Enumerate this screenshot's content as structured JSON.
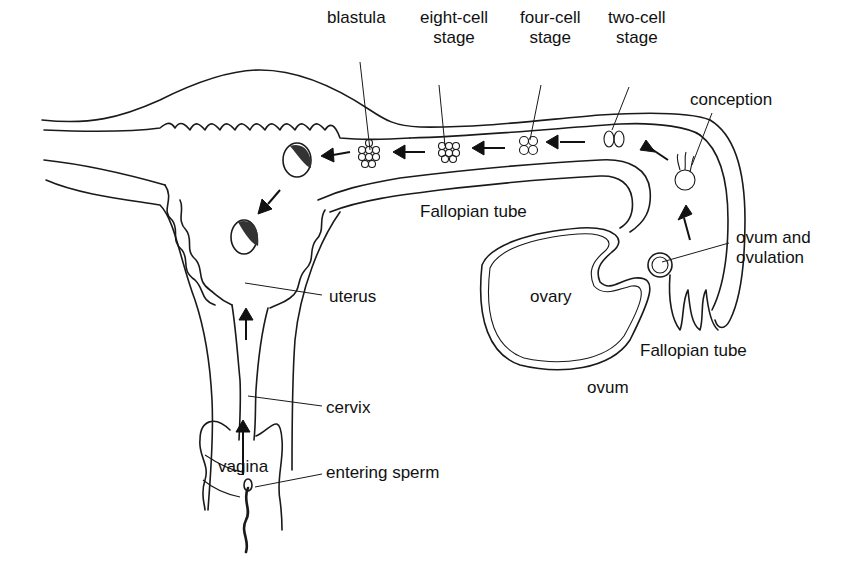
{
  "diagram": {
    "title": "",
    "labels": {
      "blastula": "blastula",
      "eight_cell_l1": "eight-cell",
      "eight_cell_l2": "stage",
      "four_cell_l1": "four-cell",
      "four_cell_l2": "stage",
      "two_cell_l1": "two-cell",
      "two_cell_l2": "stage",
      "conception": "conception",
      "fallopian_tube_upper": "Fallopian tube",
      "ovum_ovulation_l1": "ovum and",
      "ovum_ovulation_l2": "ovulation",
      "ovary": "ovary",
      "fallopian_tube_lower": "Fallopian tube",
      "ovum": "ovum",
      "uterus": "uterus",
      "cervix": "cervix",
      "vagina": "vagina",
      "entering_sperm": "entering sperm"
    },
    "stages_sequence": [
      "ovum and ovulation",
      "conception",
      "two-cell stage",
      "four-cell stage",
      "eight-cell stage",
      "blastula",
      "implantation"
    ],
    "colors": {
      "ink": "#1a1a1a",
      "background": "#ffffff"
    }
  }
}
